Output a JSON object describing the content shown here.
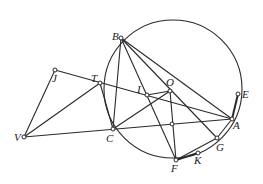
{
  "diagram": {
    "circle": {
      "cx": 173,
      "cy": 89,
      "r": 69
    },
    "points": {
      "B": {
        "x": 121,
        "y": 38,
        "label": "B",
        "lx": 112,
        "ly": 40
      },
      "J": {
        "x": 55,
        "y": 70,
        "label": "J",
        "lx": 52,
        "ly": 82
      },
      "T": {
        "x": 100,
        "y": 83,
        "label": "T",
        "lx": 91,
        "ly": 82
      },
      "I": {
        "x": 147,
        "y": 95,
        "label": "I",
        "lx": 136,
        "ly": 93
      },
      "O": {
        "x": 170,
        "y": 91,
        "label": "O",
        "lx": 166,
        "ly": 86
      },
      "E": {
        "x": 238,
        "y": 94,
        "label": "E",
        "lx": 242,
        "ly": 98
      },
      "A": {
        "x": 232,
        "y": 119,
        "label": "A",
        "lx": 233,
        "ly": 129
      },
      "V": {
        "x": 24,
        "y": 137,
        "label": "V",
        "lx": 14,
        "ly": 141
      },
      "C": {
        "x": 113,
        "y": 129,
        "label": "C",
        "lx": 105,
        "ly": 142
      },
      "M": {
        "x": 172,
        "y": 124,
        "label": "",
        "lx": 0,
        "ly": 0
      },
      "G": {
        "x": 217,
        "y": 138,
        "label": "G",
        "lx": 216,
        "ly": 151
      },
      "K": {
        "x": 198,
        "y": 153,
        "label": "K",
        "lx": 194,
        "ly": 164
      },
      "F": {
        "x": 176,
        "y": 160,
        "label": "F",
        "lx": 171,
        "ly": 172
      }
    },
    "labels": [
      "B",
      "J",
      "T",
      "I",
      "O",
      "E",
      "A",
      "V",
      "C",
      "G",
      "K",
      "F"
    ]
  }
}
